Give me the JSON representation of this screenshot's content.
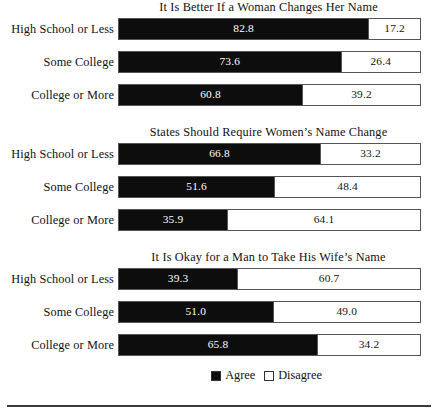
{
  "chart_data": {
    "type": "bar",
    "orientation": "horizontal",
    "layout": "stacked-100-percent",
    "panels": 3,
    "legend_position": "bottom-center",
    "grid": false,
    "xlim": [
      0,
      100
    ],
    "categories": [
      "High School or Less",
      "Some College",
      "College or More"
    ],
    "series": [
      {
        "name": "Agree",
        "color": "#0d0d0d"
      },
      {
        "name": "Disagree",
        "color": "#ffffff"
      }
    ],
    "charts": [
      {
        "title": "It Is Better If a Woman Changes Her Name",
        "categories": [
          "High School or Less",
          "Some College",
          "College or More"
        ],
        "agree": [
          82.8,
          73.6,
          60.8
        ],
        "disagree": [
          17.2,
          26.4,
          39.2
        ]
      },
      {
        "title": "States Should Require Women’s Name Change",
        "categories": [
          "High School or Less",
          "Some College",
          "College or More"
        ],
        "agree": [
          66.8,
          51.6,
          35.9
        ],
        "disagree": [
          33.2,
          48.4,
          64.1
        ]
      },
      {
        "title": "It Is Okay for a Man to Take His Wife’s Name",
        "categories": [
          "High School or Less",
          "Some College",
          "College or More"
        ],
        "agree": [
          39.3,
          51.0,
          65.8
        ],
        "disagree": [
          60.7,
          49.0,
          34.2
        ]
      }
    ]
  },
  "panels": [
    {
      "title": "It Is Better If a Woman Changes Her Name",
      "rows": [
        {
          "label": "High School or Less",
          "agree": "82.8",
          "disagree": "17.2",
          "agree_pct": 82.8,
          "disagree_pct": 17.2
        },
        {
          "label": "Some College",
          "agree": "73.6",
          "disagree": "26.4",
          "agree_pct": 73.6,
          "disagree_pct": 26.4
        },
        {
          "label": "College or More",
          "agree": "60.8",
          "disagree": "39.2",
          "agree_pct": 60.8,
          "disagree_pct": 39.2
        }
      ]
    },
    {
      "title": "States Should Require Women’s Name Change",
      "rows": [
        {
          "label": "High School or Less",
          "agree": "66.8",
          "disagree": "33.2",
          "agree_pct": 66.8,
          "disagree_pct": 33.2
        },
        {
          "label": "Some College",
          "agree": "51.6",
          "disagree": "48.4",
          "agree_pct": 51.6,
          "disagree_pct": 48.4
        },
        {
          "label": "College or More",
          "agree": "35.9",
          "disagree": "64.1",
          "agree_pct": 35.9,
          "disagree_pct": 64.1
        }
      ]
    },
    {
      "title": "It Is Okay for a Man to Take His Wife’s Name",
      "rows": [
        {
          "label": "High School or Less",
          "agree": "39.3",
          "disagree": "60.7",
          "agree_pct": 39.3,
          "disagree_pct": 60.7
        },
        {
          "label": "Some College",
          "agree": "51.0",
          "disagree": "49.0",
          "agree_pct": 51.0,
          "disagree_pct": 49.0
        },
        {
          "label": "College or More",
          "agree": "65.8",
          "disagree": "34.2",
          "agree_pct": 65.8,
          "disagree_pct": 34.2
        }
      ]
    }
  ],
  "legend": {
    "agree_label": "Agree",
    "disagree_label": "Disagree"
  },
  "colors": {
    "agree": "#0d0d0d",
    "disagree": "#ffffff",
    "border": "#555555",
    "text": "#111111"
  }
}
